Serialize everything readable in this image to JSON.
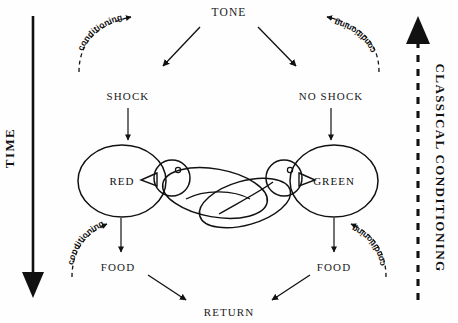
{
  "figure": {
    "type": "flow-diagram",
    "background_color": "#fefefe",
    "ink_color": "#111111"
  },
  "axes": {
    "left": {
      "label": "TIME",
      "direction": "downward",
      "line_style": "solid",
      "arrow": "filled-triangle-bottom"
    },
    "right": {
      "label": "CLASSICAL CONDITIONING",
      "direction": "upward",
      "line_style": "dashed",
      "arrow": "filled-triangle-top"
    }
  },
  "nodes": {
    "tone": "TONE",
    "shock": "SHOCK",
    "no_shock": "NO SHOCK",
    "red": "RED",
    "green": "GREEN",
    "food_left": "FOOD",
    "food_right": "FOOD",
    "return": "RETURN"
  },
  "conditioning_arcs": [
    {
      "id": "top-left",
      "label": "conditioning",
      "direction": "up-right"
    },
    {
      "id": "top-right",
      "label": "conditioning",
      "direction": "up-left"
    },
    {
      "id": "bottom-left",
      "label": "conditioning",
      "direction": "up-right"
    },
    {
      "id": "bottom-right",
      "label": "conditioning",
      "direction": "up-left"
    }
  ],
  "edges": [
    {
      "from": "TONE",
      "to": "SHOCK",
      "style": "solid-arrow"
    },
    {
      "from": "TONE",
      "to": "NO SHOCK",
      "style": "solid-arrow"
    },
    {
      "from": "SHOCK",
      "to": "RED",
      "style": "solid-arrow"
    },
    {
      "from": "NO SHOCK",
      "to": "GREEN",
      "style": "solid-arrow"
    },
    {
      "from": "RED",
      "to": "FOOD",
      "style": "solid-arrow"
    },
    {
      "from": "GREEN",
      "to": "FOOD",
      "style": "solid-arrow"
    },
    {
      "from": "FOOD",
      "to": "RETURN",
      "style": "solid-arrow"
    },
    {
      "from": "FOOD",
      "to": "RETURN",
      "style": "solid-arrow"
    }
  ],
  "illustration": {
    "description": "two pigeons facing each other between the RED and GREEN circles",
    "bird_count": 2
  }
}
